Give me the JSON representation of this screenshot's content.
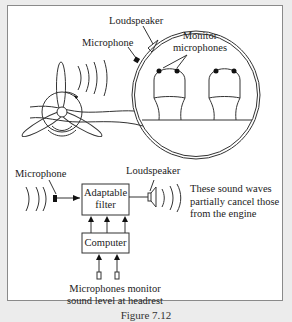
{
  "top_scene": {
    "labels": {
      "loudspeaker": "Loudspeaker",
      "microphone": "Microphone",
      "monitor_line1": "Monitor",
      "monitor_line2": "microphones"
    }
  },
  "block_diagram": {
    "microphone_label": "Microphone",
    "loudspeaker_label": "Loudspeaker",
    "filter_line1": "Adaptable",
    "filter_line2": "filter",
    "computer_label": "Computer",
    "note_line1": "These sound waves",
    "note_line2": "partially cancel those",
    "note_line3": "from the engine",
    "monitor_line1": "Microphones monitor",
    "monitor_line2": "sound level at headrest"
  },
  "caption": "Figure 7.12",
  "colors": {
    "line": "#333333",
    "background": "#ffffff",
    "page": "#ececec"
  }
}
